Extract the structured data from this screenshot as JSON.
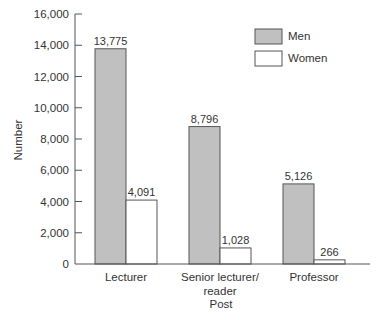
{
  "chart_data": {
    "type": "bar",
    "title": "",
    "xlabel": "Post",
    "ylabel": "Number",
    "ylim": [
      0,
      16000
    ],
    "yticks": [
      0,
      2000,
      4000,
      6000,
      8000,
      10000,
      12000,
      14000,
      16000
    ],
    "ytick_labels": [
      "0",
      "2,000",
      "4,000",
      "6,000",
      "8,000",
      "10,000",
      "12,000",
      "14,000",
      "16,000"
    ],
    "categories": [
      "Lecturer",
      "Senior lecturer/ reader",
      "Professor"
    ],
    "category_lines": [
      [
        "Lecturer"
      ],
      [
        "Senior lecturer/",
        "reader"
      ],
      [
        "Professor"
      ]
    ],
    "series": [
      {
        "name": "Men",
        "values": [
          13775,
          8796,
          5126
        ],
        "labels": [
          "13,775",
          "8,796",
          "5,126"
        ],
        "color": "#c0c0c0"
      },
      {
        "name": "Women",
        "values": [
          4091,
          1028,
          266
        ],
        "labels": [
          "4,091",
          "1,028",
          "266"
        ],
        "color": "#ffffff"
      }
    ],
    "legend": {
      "position": "top-right",
      "entries": [
        "Men",
        "Women"
      ]
    },
    "grid": false
  }
}
